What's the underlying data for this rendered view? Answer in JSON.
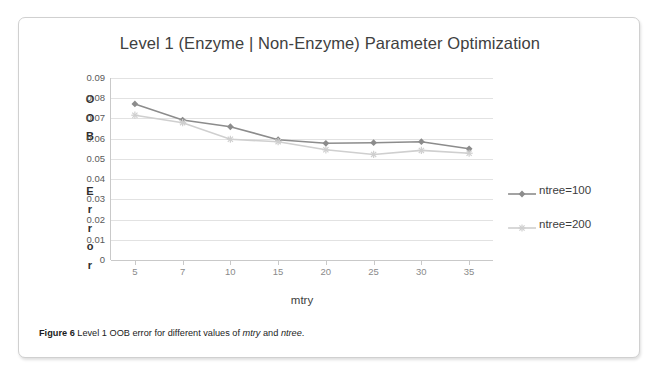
{
  "figure": {
    "caption_lead": "Figure 6",
    "caption_body_1": " Level 1 OOB error for different values of ",
    "caption_italic_1": "mtry",
    "caption_body_2": " and ",
    "caption_italic_2": "ntree",
    "caption_body_3": "."
  },
  "chart_data": {
    "type": "line",
    "title": "Level 1 (Enzyme | Non-Enzyme) Parameter Optimization",
    "xlabel": "mtry",
    "ylabel": "OOB Error",
    "ylabel_letters": [
      "O",
      "O",
      "B",
      "",
      "E",
      "r",
      "r",
      "o",
      "r"
    ],
    "categories": [
      "5",
      "7",
      "10",
      "15",
      "20",
      "25",
      "30",
      "35"
    ],
    "x": [
      5,
      7,
      10,
      15,
      20,
      25,
      30,
      35
    ],
    "ylim": [
      0,
      0.09
    ],
    "yticks": [
      "0.09",
      "0.08",
      "0.07",
      "0.06",
      "0.05",
      "0.04",
      "0.03",
      "0.02",
      "0.01",
      "0"
    ],
    "ytick_values": [
      0.09,
      0.08,
      0.07,
      0.06,
      0.05,
      0.04,
      0.03,
      0.02,
      0.01,
      0
    ],
    "grid": true,
    "legend_position": "right",
    "series": [
      {
        "name": "ntree=100",
        "color": "#8c8c8c",
        "marker": "diamond",
        "values": [
          0.0772,
          0.0692,
          0.0659,
          0.0595,
          0.0577,
          0.058,
          0.0585,
          0.055
        ]
      },
      {
        "name": "ntree=200",
        "color": "#cfcfcf",
        "marker": "star",
        "values": [
          0.0716,
          0.0679,
          0.0597,
          0.0585,
          0.0545,
          0.0522,
          0.0542,
          0.0528
        ]
      }
    ]
  }
}
